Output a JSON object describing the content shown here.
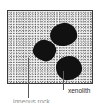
{
  "figure": {
    "name": "xenolith-in-igneous-rock-diagram",
    "frame": {
      "texture_name": "stipple-speckle-texture",
      "fill_color": "#f2f2f2",
      "border_color": "#3a3a3a"
    },
    "inclusions": {
      "fill_color": "#111111",
      "items": [
        {
          "name": "xenolith-blob-top",
          "shape": "irregular-dark-blob"
        },
        {
          "name": "xenolith-blob-mid",
          "shape": "irregular-dark-blob"
        },
        {
          "name": "xenolith-blob-low",
          "shape": "irregular-dark-blob"
        }
      ]
    },
    "annotations": [
      {
        "name": "xenolith",
        "label": "xenolith",
        "leader_name": "leader-xenolith",
        "points_to": "xenolith-blob-low"
      },
      {
        "name": "igneous-rock",
        "label": "igneous rock",
        "leader_name": "leader-igneous",
        "points_to": "rock-texture",
        "clipped": "true"
      }
    ],
    "leader_color": "#5a5a5a",
    "label_color": "#2b2b2b"
  }
}
